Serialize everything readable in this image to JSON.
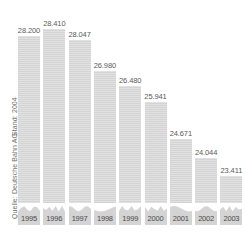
{
  "caption": {
    "credit": "Quelle: Deutsche Bahn AG",
    "as_of": "Stand: 2004"
  },
  "colors": {
    "bar_fill": "#d4d4d4",
    "value_label": "#5a5a5a",
    "year_label": "#4a4a4a",
    "caption": "#6f6f6f",
    "background": "#ffffff"
  },
  "chart_data": {
    "type": "bar",
    "title": "",
    "subtitle": "",
    "xlabel": "",
    "ylabel": "",
    "grid": false,
    "legend": "none",
    "axis_break": true,
    "categories": [
      "1995",
      "1996",
      "1997",
      "1998",
      "1999",
      "2000",
      "2001",
      "2002",
      "2003"
    ],
    "values": [
      28200,
      28410,
      28047,
      26980,
      26480,
      25941,
      24671,
      24044,
      23411
    ],
    "value_labels": [
      "28.200",
      "28.410",
      "28.047",
      "26.980",
      "26.480",
      "25.941",
      "24.671",
      "24.044",
      "23.411"
    ],
    "ylim": [
      22500,
      28800
    ],
    "annotations": [
      "Quelle: Deutsche Bahn AG",
      "Stand: 2004"
    ]
  }
}
